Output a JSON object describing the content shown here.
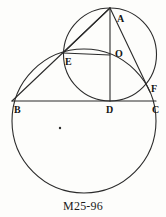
{
  "figure": {
    "caption": "M25-96",
    "stroke_color": "#2b2b2b",
    "background_color": "#fdfdfb",
    "label_color": "#141414",
    "canvas": {
      "width": 166,
      "height": 217
    },
    "circles": [
      {
        "name": "large-circle",
        "cx": 84,
        "cy": 121,
        "r": 72
      },
      {
        "name": "small-circle",
        "cx": 110,
        "cy": 54.5,
        "r": 46.5
      }
    ],
    "points": [
      {
        "id": "A",
        "label": "A",
        "x": 110,
        "y": 8,
        "label_x": 117,
        "label_y": 14
      },
      {
        "id": "O",
        "label": "O",
        "x": 110,
        "y": 55,
        "label_x": 115,
        "label_y": 49
      },
      {
        "id": "E",
        "label": "E",
        "x": 63,
        "y": 53,
        "label_x": 65,
        "label_y": 57
      },
      {
        "id": "B",
        "label": "B",
        "x": 12,
        "y": 101,
        "label_x": 14,
        "label_y": 105
      },
      {
        "id": "D",
        "label": "D",
        "x": 110,
        "y": 101,
        "label_x": 106,
        "label_y": 105
      },
      {
        "id": "C",
        "label": "C",
        "x": 156,
        "y": 101,
        "label_x": 152,
        "label_y": 105
      },
      {
        "id": "F",
        "label": "F",
        "x": 150,
        "y": 92,
        "label_x": 151,
        "label_y": 84
      }
    ],
    "segments": [
      {
        "name": "segment-AB",
        "from": "A",
        "to": "B"
      },
      {
        "name": "segment-AE",
        "from": "A",
        "to": "E"
      },
      {
        "name": "segment-AD",
        "from": "A",
        "to": "D"
      },
      {
        "name": "segment-AF",
        "from": "A",
        "to": "F"
      },
      {
        "name": "segment-BC",
        "from": "B",
        "to": "C"
      },
      {
        "name": "segment-EO",
        "from": "E",
        "to": "O"
      }
    ],
    "marks": [
      {
        "name": "center-dot",
        "x": 60,
        "y": 128,
        "r": 1.2
      }
    ]
  }
}
